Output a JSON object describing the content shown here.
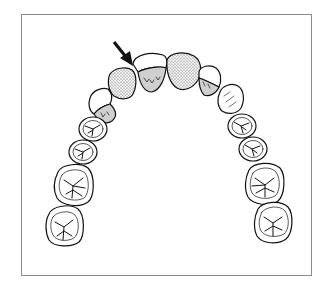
{
  "figure": {
    "title": "Maxillary dental arch (occlusal view)",
    "frame_color": "#8a8a8a",
    "outline_color": "#111111",
    "shade_gray": "#cfcfcf",
    "stipple_color": "#555555"
  },
  "annotation": {
    "arrow": "arrow-icon",
    "points_to": "left lateral incisor / central incisor contact"
  },
  "teeth": [
    {
      "id": "left-central-incisor",
      "fill": "white-with-gray-lingual"
    },
    {
      "id": "right-central-incisor",
      "fill": "stippled"
    },
    {
      "id": "left-lateral-incisor",
      "fill": "stippled"
    },
    {
      "id": "right-lateral-incisor",
      "fill": "white-with-gray-lingual"
    },
    {
      "id": "left-canine",
      "fill": "white-with-gray-lingual"
    },
    {
      "id": "right-canine",
      "fill": "white-with-lines"
    },
    {
      "id": "left-first-premolar",
      "fill": "occlusal"
    },
    {
      "id": "left-second-premolar",
      "fill": "occlusal"
    },
    {
      "id": "left-first-molar",
      "fill": "occlusal"
    },
    {
      "id": "left-second-molar",
      "fill": "occlusal"
    },
    {
      "id": "right-first-premolar",
      "fill": "occlusal"
    },
    {
      "id": "right-second-premolar",
      "fill": "occlusal"
    },
    {
      "id": "right-first-molar",
      "fill": "occlusal"
    },
    {
      "id": "right-second-molar",
      "fill": "occlusal"
    }
  ]
}
